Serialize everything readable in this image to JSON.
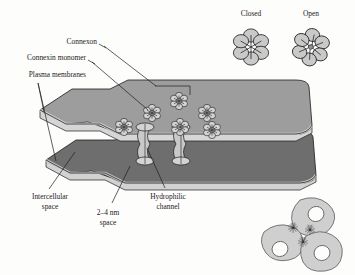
{
  "figure": {
    "background_color": "#fdfdfc",
    "ink_color": "#1c1c1c"
  },
  "labels": {
    "connexon": "Connexon",
    "connexin_monomer": "Connexin monomer",
    "plasma_membranes": "Plasma membranes",
    "intercellular_space_line1": "Intercellular",
    "intercellular_space_line2": "space",
    "gap_line1": "2–4 nm",
    "gap_line2": "space",
    "hydrophilic_line1": "Hydrophilic",
    "hydrophilic_line2": "channel",
    "closed": "Closed",
    "open": "Open"
  },
  "colors": {
    "membrane_top_face": "#9d9d9d",
    "membrane_top_edge": "#d6d6d6",
    "membrane_bottom_face": "#6e6e6e",
    "membrane_bottom_edge": "#d2d2d2",
    "connexon_fill": "#d3d3d3",
    "cell_fill": "#cfcfcf",
    "nucleus_fill": "#fdfdfc",
    "outline": "#1c1c1c"
  },
  "structures": {
    "top_membrane_connexons": 6,
    "channel_pairs": 2,
    "rosette_petals": 6,
    "cluster_cells": 3,
    "cluster_starbursts": 3
  }
}
